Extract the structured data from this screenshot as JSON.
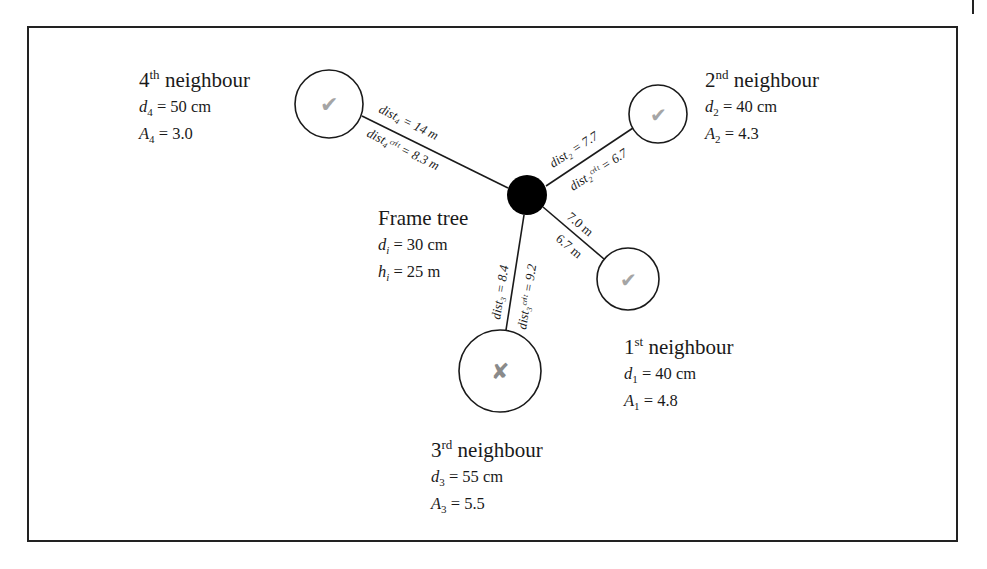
{
  "diagram": {
    "frame_tree": {
      "title": "Frame tree",
      "d_symbol": "d",
      "d_sub": "i",
      "d_value": " = 30 cm",
      "h_symbol": "h",
      "h_sub": "i",
      "h_value": " = 25 m"
    },
    "neighbours": [
      {
        "ordinal": "1",
        "ordinal_suffix": "st",
        "title_suffix": " neighbour",
        "d_symbol": "d",
        "d_sub": "1",
        "d_value": " = 40 cm",
        "a_symbol": "A",
        "a_sub": "1",
        "a_value": " = 4.8",
        "dist_label": "7.0 m",
        "dist_crit_label": "6.7 m",
        "status": "check"
      },
      {
        "ordinal": "2",
        "ordinal_suffix": "nd",
        "title_suffix": " neighbour",
        "d_symbol": "d",
        "d_sub": "2",
        "d_value": " = 40 cm",
        "a_symbol": "A",
        "a_sub": "2",
        "a_value": " = 4.3",
        "dist_label": "dist₂ = 7.7",
        "dist_crit_label": "dist₂ᶜʳⁱᵗ = 6.7",
        "status": "check"
      },
      {
        "ordinal": "3",
        "ordinal_suffix": "rd",
        "title_suffix": " neighbour",
        "d_symbol": "d",
        "d_sub": "3",
        "d_value": " = 55 cm",
        "a_symbol": "A",
        "a_sub": "3",
        "a_value": " = 5.5",
        "dist_label": "dist₃ = 8.4",
        "dist_crit_label": "dist₃ᶜʳⁱᵗ = 9.2",
        "status": "cross"
      },
      {
        "ordinal": "4",
        "ordinal_suffix": "th",
        "title_suffix": " neighbour",
        "d_symbol": "d",
        "d_sub": "4",
        "d_value": " = 50 cm",
        "a_symbol": "A",
        "a_sub": "4",
        "a_value": " = 3.0",
        "dist_label": "dist₄ = 14 m",
        "dist_crit_label": "dist₄ᶜʳⁱᵗ = 8.3 m",
        "status": "check"
      }
    ],
    "icons": {
      "check": "✔",
      "cross": "✘"
    },
    "colors": {
      "stroke": "#1a1a1a",
      "node_fill": "#000000",
      "mark": "#9a9a9a"
    }
  }
}
